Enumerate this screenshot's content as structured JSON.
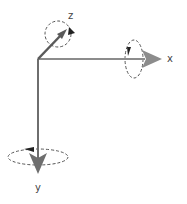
{
  "diagram": {
    "colors": {
      "axis": "#7a7a7a",
      "x_arrow": "#8c8c8c",
      "y_arrow": "#6e6e6e",
      "z_arrow": "#5a5a5a",
      "rotation": "#555555",
      "rotation_arrow": "#222222",
      "label": "#444444"
    },
    "axes": [
      {
        "id": "x",
        "label": "x",
        "direction": "right"
      },
      {
        "id": "y",
        "label": "y",
        "direction": "down"
      },
      {
        "id": "z",
        "label": "z",
        "direction": "out-of-page (diagonal up-right)"
      }
    ],
    "rotations": [
      {
        "axis": "x",
        "style": "dashed ellipse"
      },
      {
        "axis": "y",
        "style": "dashed ellipse"
      },
      {
        "axis": "z",
        "style": "dashed circle"
      }
    ]
  }
}
